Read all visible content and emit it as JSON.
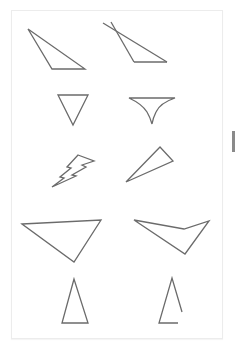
{
  "worksheet": {
    "shapes": [
      {
        "id": "shape-1",
        "kind": "obtuse-triangle",
        "points": "28,29 52,69 85,69"
      },
      {
        "id": "shape-2",
        "kind": "triangle-with-crossing-overshoot",
        "lines": [
          [
            103,
            23,
            167,
            62
          ],
          [
            111,
            22,
            134,
            62
          ],
          [
            134,
            62,
            167,
            62
          ]
        ]
      },
      {
        "id": "shape-3",
        "kind": "inverted-triangle",
        "points": "58,95 88,95 73,125"
      },
      {
        "id": "shape-4",
        "kind": "funnel-curved-triangle",
        "path": "M129,98 L175,98 Q160,103 156,112 Q153,118 152,124 Q150,117 147,112 Q142,104 129,98 Z"
      },
      {
        "id": "shape-5",
        "kind": "lightning-bolt",
        "points": "78,155 94,161 82,165 86,167 72,175 76,176 52,187 64,178 60,177 71,168 67,167"
      },
      {
        "id": "shape-6",
        "kind": "thin-triangle",
        "points": "126,182 160,147 173,161"
      },
      {
        "id": "shape-7",
        "kind": "large-obtuse-triangle",
        "points": "22,224 101,220 74,262"
      },
      {
        "id": "shape-8",
        "kind": "concave-quadrilateral",
        "points": "134,220 184,229 209,221 185,254"
      },
      {
        "id": "shape-9",
        "kind": "tall-isosceles-triangle",
        "points": "74,279 62,323 88,323"
      },
      {
        "id": "shape-10",
        "kind": "open-triangle",
        "polyline": "182,312 172,278 159,323 178,323"
      }
    ],
    "colors": {
      "stroke": "#6b6b6b",
      "card_border": "#ececec",
      "background": "#ffffff",
      "edge_mark": "#8a8a8a"
    }
  }
}
